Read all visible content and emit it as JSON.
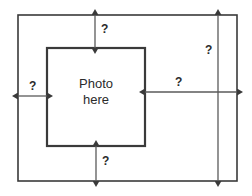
{
  "diagram": {
    "background_color": "#ffffff",
    "line_color": "#3a3a3a",
    "text_color": "#2b2b2b",
    "outer_frame": {
      "name": "outer-frame",
      "x": 18,
      "y": 15,
      "width": 219,
      "height": 166
    },
    "inner_frame": {
      "name": "photo-placeholder",
      "x": 47,
      "y": 48,
      "width": 98,
      "height": 98,
      "label_line1": "Photo",
      "label_line2": "here"
    },
    "measurements": [
      {
        "name": "top-margin",
        "label": "?",
        "orientation": "vertical",
        "from": [
          95,
          15
        ],
        "to": [
          95,
          48
        ],
        "label_x": 101,
        "label_y": 23
      },
      {
        "name": "left-margin",
        "label": "?",
        "orientation": "horizontal",
        "from": [
          18,
          96
        ],
        "to": [
          47,
          96
        ],
        "label_x": 29,
        "label_y": 80
      },
      {
        "name": "right-span",
        "label": "?",
        "orientation": "horizontal",
        "from": [
          145,
          92
        ],
        "to": [
          237,
          92
        ],
        "label_x": 175,
        "label_y": 76
      },
      {
        "name": "right-height",
        "label": "?",
        "orientation": "vertical",
        "from": [
          218,
          15
        ],
        "to": [
          218,
          181
        ],
        "label_x": 205,
        "label_y": 44
      },
      {
        "name": "bottom-margin",
        "label": "?",
        "orientation": "vertical",
        "from": [
          96,
          146
        ],
        "to": [
          96,
          181
        ],
        "label_x": 102,
        "label_y": 155
      }
    ]
  }
}
